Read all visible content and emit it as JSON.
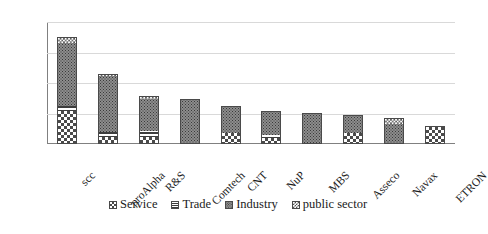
{
  "chart_data": {
    "type": "bar",
    "stacked": true,
    "title": "",
    "xlabel": "",
    "ylabel": "",
    "ylim": [
      0,
      200
    ],
    "yticks": [
      "0",
      "50",
      "100",
      "150",
      "200"
    ],
    "grid": true,
    "legend_position": "bottom",
    "categories": [
      "scc",
      "proAlpha",
      "R&S",
      "Comtech",
      "CNT",
      "NuP",
      "MBS",
      "Asseco",
      "Navax",
      "ETRON"
    ],
    "series": [
      {
        "name": "Service",
        "pattern": "checkerboard-large",
        "values": [
          54,
          12,
          12,
          0,
          18,
          10,
          0,
          18,
          0,
          30
        ]
      },
      {
        "name": "Trade",
        "pattern": "horizontal-stripes",
        "values": [
          8,
          8,
          9,
          0,
          0,
          4,
          0,
          0,
          0,
          0
        ]
      },
      {
        "name": "Industry",
        "pattern": "gray-dotted",
        "values": [
          104,
          92,
          52,
          74,
          44,
          40,
          51,
          30,
          32,
          0
        ]
      },
      {
        "name": "public sector",
        "pattern": "checkerboard-small",
        "values": [
          10,
          3,
          6,
          0,
          0,
          0,
          0,
          0,
          11,
          0
        ]
      }
    ],
    "totals": [
      176,
      115,
      79,
      74,
      62,
      54,
      51,
      48,
      43,
      30
    ]
  },
  "legend": {
    "items": [
      {
        "label": "Service",
        "swatch": "checkerboard-large-icon"
      },
      {
        "label": "Trade",
        "swatch": "horizontal-stripes-icon"
      },
      {
        "label": "Industry",
        "swatch": "gray-dotted-icon"
      },
      {
        "label": "public sector",
        "swatch": "checkerboard-small-icon"
      }
    ]
  },
  "colors": {
    "gridline": "#d9d9d9",
    "axis": "#808080",
    "text": "#1a1a1a",
    "industry_fill": "#8d8d8d",
    "pattern_ink": "#4a4a4a"
  }
}
